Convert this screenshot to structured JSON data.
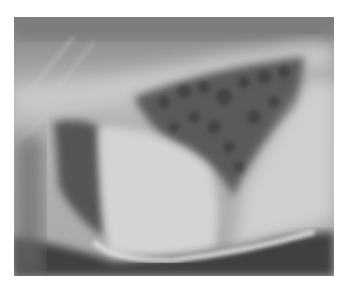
{
  "image": {
    "subject": "radiograph",
    "description": "Grayscale lateral thoracic X-ray",
    "colors": {
      "background": "#ffffff",
      "frame_base": "#9a9a9a",
      "bright": "#d8d8d8",
      "dark": "#3a3a3a",
      "lung_dark": "#555555"
    }
  }
}
